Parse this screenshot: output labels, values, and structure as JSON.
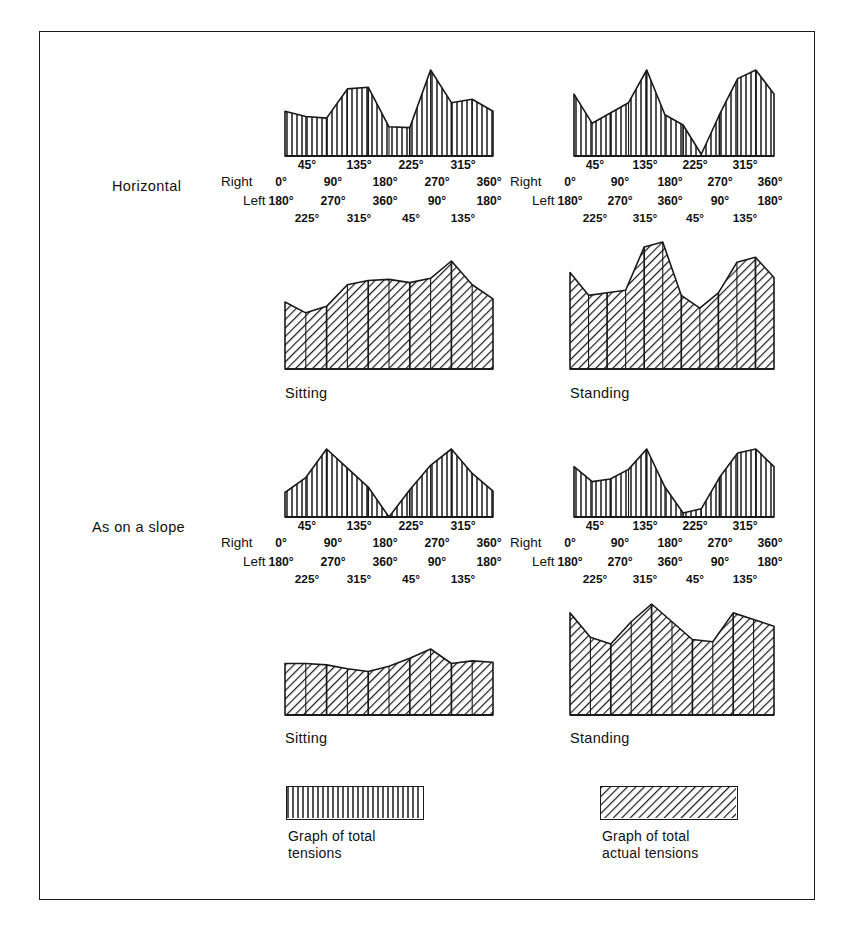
{
  "figure": {
    "width": 851,
    "height": 933,
    "border_color": "#1a1a1a",
    "background": "#ffffff"
  },
  "row_labels": [
    {
      "name": "horizontal",
      "text": "Horizontal",
      "x": 112,
      "y": 178
    },
    {
      "name": "as-on-a-slope",
      "text": "As on a slope",
      "x": 92,
      "y": 519
    }
  ],
  "axis": {
    "side_labels": {
      "right": "Right",
      "left": "Left"
    },
    "upper_ticks": [
      "45°",
      "135°",
      "225°",
      "315°"
    ],
    "right_ticks": [
      "0°",
      "90°",
      "180°",
      "270°",
      "360°"
    ],
    "left_ticks": [
      "180°",
      "270°",
      "360°",
      "90°",
      "180°"
    ],
    "left_lower_ticks": [
      "225°",
      "315°",
      "45°",
      "135°"
    ]
  },
  "legend": {
    "items": [
      {
        "name": "total-tensions",
        "pattern": "vertical",
        "line1": "Graph of total",
        "line2": "tensions",
        "swatch_x": 286,
        "swatch_y": 786,
        "swatch_w": 138,
        "swatch_h": 34,
        "text_x": 288,
        "text_y": 828
      },
      {
        "name": "total-actual-tensions",
        "pattern": "diagonal",
        "line1": "Graph of total",
        "line2": "actual tensions",
        "swatch_x": 600,
        "swatch_y": 786,
        "swatch_w": 138,
        "swatch_h": 34,
        "text_x": 602,
        "text_y": 828
      }
    ]
  },
  "chart_data": {
    "type": "area",
    "xlabel": "Direction of pull (degrees)",
    "ylabel": "Tension",
    "grid": false,
    "legend_position": "bottom",
    "x_axis": {
      "right_sequence": [
        "0°",
        "45°",
        "90°",
        "135°",
        "180°",
        "225°",
        "270°",
        "315°",
        "360°"
      ],
      "left_sequence": [
        "180°",
        "225°",
        "270°",
        "315°",
        "360°",
        "45°",
        "90°",
        "135°",
        "180°"
      ]
    },
    "panels": [
      {
        "name": "horizontal-total-tensions",
        "condition": "Horizontal",
        "series_name": "Graph of total tensions",
        "pattern": "vertical",
        "caption": "",
        "has_axis": true,
        "categories": [
          "0°",
          "45°",
          "90°",
          "135°",
          "180°",
          "225°",
          "270°",
          "315°",
          "360°"
        ],
        "values": [
          52,
          46,
          44,
          78,
          80,
          34,
          33,
          100,
          62,
          66,
          52
        ]
      },
      {
        "name": "horizontal-total-actual-tensions",
        "condition": "Horizontal",
        "series_name": "Graph of total actual tensions",
        "pattern": "vertical",
        "caption": "",
        "has_axis": true,
        "categories": [
          "0°",
          "45°",
          "90°",
          "135°",
          "180°",
          "225°",
          "270°",
          "315°",
          "360°"
        ],
        "values": [
          72,
          38,
          50,
          62,
          100,
          48,
          36,
          2,
          48,
          90,
          100,
          72
        ]
      },
      {
        "name": "horizontal-sitting",
        "condition": "Horizontal",
        "series_name": "Sitting",
        "pattern": "diagonal",
        "caption": "Sitting",
        "has_axis": false,
        "categories": [
          "0°",
          "45°",
          "90°",
          "135°",
          "180°",
          "225°",
          "270°",
          "315°",
          "360°"
        ],
        "values": [
          62,
          52,
          58,
          78,
          82,
          83,
          80,
          84,
          100,
          78,
          65
        ]
      },
      {
        "name": "horizontal-standing",
        "condition": "Horizontal",
        "series_name": "Standing",
        "pattern": "diagonal",
        "caption": "Standing",
        "has_axis": false,
        "categories": [
          "0°",
          "45°",
          "90°",
          "135°",
          "180°",
          "225°",
          "270°",
          "315°",
          "360°"
        ],
        "values": [
          76,
          58,
          60,
          62,
          96,
          100,
          58,
          48,
          60,
          84,
          88,
          72
        ]
      },
      {
        "name": "slope-total-tensions",
        "condition": "As on a slope",
        "series_name": "Graph of total tensions",
        "pattern": "vertical",
        "caption": "",
        "has_axis": true,
        "categories": [
          "0°",
          "45°",
          "90°",
          "135°",
          "180°",
          "225°",
          "270°",
          "315°",
          "360°"
        ],
        "values": [
          36,
          58,
          100,
          72,
          44,
          0,
          40,
          76,
          100,
          64,
          38
        ]
      },
      {
        "name": "slope-total-actual-tensions",
        "condition": "As on a slope",
        "series_name": "Graph of total actual tensions",
        "pattern": "vertical",
        "caption": "",
        "has_axis": true,
        "categories": [
          "0°",
          "45°",
          "90°",
          "135°",
          "180°",
          "225°",
          "270°",
          "315°",
          "360°"
        ],
        "values": [
          74,
          52,
          56,
          70,
          100,
          44,
          6,
          12,
          58,
          94,
          100,
          74
        ]
      },
      {
        "name": "slope-sitting",
        "condition": "As on a slope",
        "series_name": "Sitting",
        "pattern": "diagonal",
        "caption": "Sitting",
        "has_axis": false,
        "categories": [
          "0°",
          "45°",
          "90°",
          "135°",
          "180°",
          "225°",
          "270°",
          "315°",
          "360°"
        ],
        "values": [
          78,
          78,
          76,
          70,
          66,
          74,
          86,
          100,
          78,
          82,
          80
        ]
      },
      {
        "name": "slope-standing",
        "condition": "As on a slope",
        "series_name": "Standing",
        "pattern": "diagonal",
        "caption": "Standing",
        "has_axis": false,
        "categories": [
          "0°",
          "45°",
          "90°",
          "135°",
          "180°",
          "225°",
          "270°",
          "315°",
          "360°"
        ],
        "values": [
          92,
          70,
          64,
          84,
          100,
          84,
          68,
          66,
          92,
          86,
          80
        ]
      }
    ]
  },
  "panel_layout": [
    {
      "panel": 0,
      "x": 281,
      "y": 64,
      "w": 208,
      "h": 92
    },
    {
      "panel": 1,
      "x": 570,
      "y": 64,
      "w": 200,
      "h": 92
    },
    {
      "panel": 2,
      "x": 281,
      "y": 255,
      "w": 208,
      "h": 114
    },
    {
      "panel": 3,
      "x": 566,
      "y": 236,
      "w": 204,
      "h": 133
    },
    {
      "panel": 4,
      "x": 281,
      "y": 443,
      "w": 208,
      "h": 74
    },
    {
      "panel": 5,
      "x": 570,
      "y": 443,
      "w": 200,
      "h": 74
    },
    {
      "panel": 6,
      "x": 281,
      "y": 643,
      "w": 208,
      "h": 72
    },
    {
      "panel": 7,
      "x": 566,
      "y": 598,
      "w": 204,
      "h": 117
    }
  ],
  "axis_blocks": [
    {
      "name": "axis-horizontal-left",
      "x": 281,
      "w": 208,
      "top": 156,
      "side_x": 231
    },
    {
      "name": "axis-horizontal-right",
      "x": 570,
      "w": 200,
      "top": 156,
      "side_x": 520
    },
    {
      "name": "axis-slope-left",
      "x": 281,
      "w": 208,
      "top": 517,
      "side_x": 231
    },
    {
      "name": "axis-slope-right",
      "x": 570,
      "w": 200,
      "top": 517,
      "side_x": 520
    }
  ],
  "captions": [
    {
      "name": "caption-sitting-horizontal",
      "text": "Sitting",
      "x": 285,
      "y": 385
    },
    {
      "name": "caption-standing-horizontal",
      "text": "Standing",
      "x": 570,
      "y": 385
    },
    {
      "name": "caption-sitting-slope",
      "text": "Sitting",
      "x": 285,
      "y": 730
    },
    {
      "name": "caption-standing-slope",
      "text": "Standing",
      "x": 570,
      "y": 730
    }
  ]
}
